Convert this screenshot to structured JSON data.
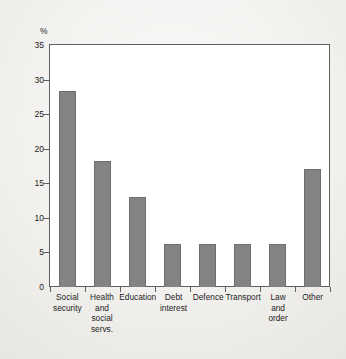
{
  "chart_data": {
    "type": "bar",
    "title": "",
    "subtitle": "",
    "xlabel": "",
    "ylabel": "%",
    "ylim": [
      0,
      35
    ],
    "yticks": [
      0,
      5,
      10,
      15,
      20,
      25,
      30,
      35
    ],
    "ytick_labels": [
      "0",
      "5",
      "10",
      "15",
      "20",
      "25",
      "30",
      "35"
    ],
    "grid": false,
    "legend": null,
    "bar_color": "#838383",
    "plot_background": "#ffffff",
    "page_background": "#f1f0ed",
    "categories": [
      "Social security",
      "Health and social servs.",
      "Education",
      "Debt interest",
      "Defence",
      "Transport",
      "Law and order",
      "Other"
    ],
    "category_lines": [
      [
        "Social",
        "security"
      ],
      [
        "Health",
        "and",
        "social",
        "servs."
      ],
      [
        "Education"
      ],
      [
        "Debt",
        "interest"
      ],
      [
        "Defence"
      ],
      [
        "Transport"
      ],
      [
        "Law",
        "and",
        "order"
      ],
      [
        "Other"
      ]
    ],
    "values": [
      28.3,
      18.2,
      13.0,
      6.2,
      6.2,
      6.2,
      6.2,
      17.0
    ]
  }
}
